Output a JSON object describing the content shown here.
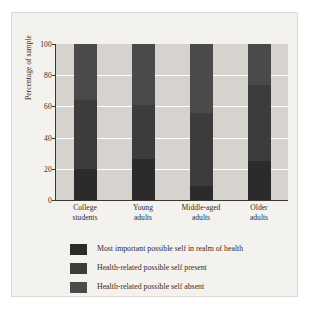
{
  "chart_data": {
    "type": "bar",
    "subtype": "stacked-bar",
    "title": "",
    "xlabel": "",
    "ylabel": "Percentage of sample",
    "ylim": [
      0,
      100
    ],
    "yticks": [
      0,
      20,
      40,
      60,
      80,
      100
    ],
    "ytick_labels": [
      "0",
      "20",
      "40",
      "60",
      "80",
      "100"
    ],
    "grid": "horizontal-white",
    "legend_position": "bottom-left",
    "categories": [
      "College students",
      "Young adults",
      "Middle-aged adults",
      "Older adults"
    ],
    "category_lines": [
      [
        "College",
        "students"
      ],
      [
        "Young",
        "adults"
      ],
      [
        "Middle-aged",
        "adults"
      ],
      [
        "Older",
        "adults"
      ]
    ],
    "series": [
      {
        "name": "Most important possible self in realm of health",
        "color": "#2b2b2b",
        "values": [
          20,
          26,
          9,
          25
        ]
      },
      {
        "name": "Health-related possible self present",
        "color": "#3c3c3c",
        "values": [
          44,
          35,
          47,
          49
        ]
      },
      {
        "name": "Health-related possible self absent",
        "color": "#4a4a4a",
        "values": [
          36,
          39,
          44,
          26
        ]
      }
    ],
    "colors": {
      "plot_background": "#d6d3ce",
      "card_background": "#f4f2ef",
      "gridline": "#ffffff",
      "axis": "#3a3733",
      "text": "#2f2c29"
    }
  },
  "legend": {
    "items": [
      {
        "label": "Most important possible self in realm of health",
        "swatch": "#2b2b2b"
      },
      {
        "label": "Health-related possible self present",
        "swatch": "#3c3c3c"
      },
      {
        "label": "Health-related possible self absent",
        "swatch": "#4a4a4a"
      }
    ]
  }
}
